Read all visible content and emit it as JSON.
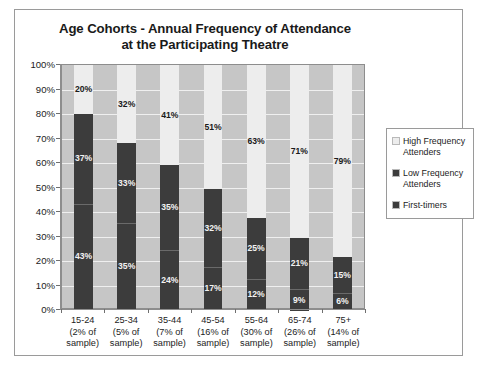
{
  "chart_data": {
    "type": "bar",
    "subtype": "stacked-100-percent",
    "title": "Age Cohorts - Annual Frequency of Attendance at the Participating Theatre",
    "title_lines": [
      "Age Cohorts - Annual Frequency of Attendance",
      "at the Participating Theatre"
    ],
    "xlabel": "",
    "ylabel": "",
    "ylim": [
      0,
      100
    ],
    "ytick_labels": [
      "100%",
      "90%",
      "80%",
      "70%",
      "60%",
      "50%",
      "40%",
      "30%",
      "20%",
      "10%",
      "0%"
    ],
    "ytick_values": [
      100,
      90,
      80,
      70,
      60,
      50,
      40,
      30,
      20,
      10,
      0
    ],
    "grid": true,
    "legend_position": "right",
    "categories": [
      "15-24",
      "25-34",
      "35-44",
      "45-54",
      "55-64",
      "65-74",
      "75+"
    ],
    "category_sublabels": [
      "(2% of sample)",
      "(5% of sample)",
      "(7% of sample)",
      "(16% of sample)",
      "(30% of sample)",
      "(26% of sample)",
      "(14% of sample)"
    ],
    "category_sample_shares": [
      2,
      5,
      7,
      16,
      30,
      26,
      14
    ],
    "series": [
      {
        "name": "High Frequency Attenders",
        "color": "#ededed",
        "values": [
          20,
          32,
          41,
          51,
          63,
          71,
          79
        ],
        "labels": [
          "20%",
          "32%",
          "41%",
          "51%",
          "63%",
          "71%",
          "79%"
        ]
      },
      {
        "name": "Low Frequency Attenders",
        "color": "#3c3c3c",
        "values": [
          37,
          33,
          35,
          32,
          25,
          21,
          15
        ],
        "labels": [
          "37%",
          "33%",
          "35%",
          "32%",
          "25%",
          "21%",
          "15%"
        ]
      },
      {
        "name": "First-timers",
        "color": "#3c3c3c",
        "values": [
          43,
          35,
          24,
          17,
          12,
          9,
          6
        ],
        "labels": [
          "43%",
          "35%",
          "24%",
          "17%",
          "12%",
          "9%",
          "6%"
        ]
      }
    ]
  },
  "x_axis_lines": [
    [
      "15-24",
      "(2% of",
      "sample)"
    ],
    [
      "25-34",
      "(5% of",
      "sample)"
    ],
    [
      "35-44",
      "(7% of",
      "sample)"
    ],
    [
      "45-54",
      "(16% of",
      "sample)"
    ],
    [
      "55-64",
      "(30% of",
      "sample)"
    ],
    [
      "65-74",
      "(26% of",
      "sample)"
    ],
    [
      "75+",
      "(14% of",
      "sample)"
    ]
  ],
  "legend": {
    "items": [
      {
        "label_line1": "High Frequency",
        "label_line2": "Attenders",
        "color": "#ededed"
      },
      {
        "label_line1": "Low Frequency",
        "label_line2": "Attenders",
        "color": "#3c3c3c"
      },
      {
        "label_line1": "First-timers",
        "label_line2": "",
        "color": "#3c3c3c"
      }
    ]
  },
  "colors": {
    "plot_background": "#c6c6c6",
    "gridline": "#efefef",
    "frame_border": "#9a9a9a",
    "axis": "#8d8d8d",
    "text": "#1c1c1c"
  }
}
